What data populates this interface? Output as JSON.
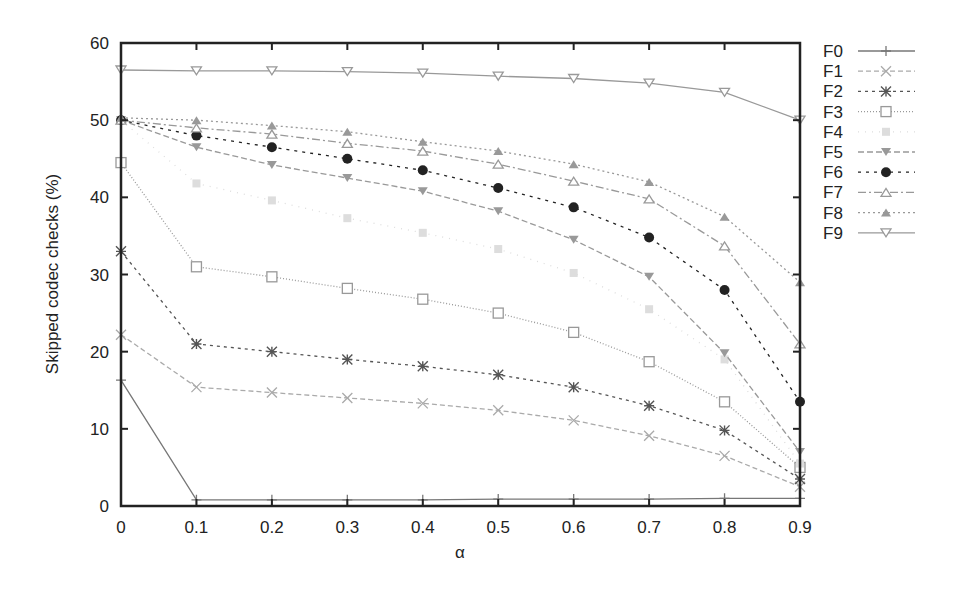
{
  "chart_data": {
    "type": "line",
    "title": "",
    "xlabel": "α",
    "ylabel": "Skipped codec checks (%)",
    "x": [
      0,
      0.1,
      0.2,
      0.3,
      0.4,
      0.5,
      0.6,
      0.7,
      0.8,
      0.9
    ],
    "x_tick_labels": [
      "0",
      "0.1",
      "0.2",
      "0.3",
      "0.4",
      "0.5",
      "0.6",
      "0.7",
      "0.8",
      "0.9"
    ],
    "y_ticks": [
      0,
      10,
      20,
      30,
      40,
      50,
      60
    ],
    "xlim": [
      0,
      0.9
    ],
    "ylim": [
      0,
      60
    ],
    "grid": false,
    "legend_position": "right-outside",
    "series": [
      {
        "name": "F0",
        "marker": "plus",
        "dash": "",
        "color": "#777777",
        "values": [
          16.3,
          0.8,
          0.8,
          0.8,
          0.8,
          0.9,
          0.9,
          0.9,
          1.0,
          1.0
        ]
      },
      {
        "name": "F1",
        "marker": "cross",
        "dash": "5,3",
        "color": "#aaaaaa",
        "values": [
          22.2,
          15.4,
          14.7,
          14.0,
          13.3,
          12.4,
          11.1,
          9.1,
          6.5,
          2.5
        ]
      },
      {
        "name": "F2",
        "marker": "star",
        "dash": "3,4",
        "color": "#555555",
        "values": [
          33.0,
          21.0,
          20.0,
          19.0,
          18.1,
          17.0,
          15.4,
          13.0,
          9.8,
          3.5
        ]
      },
      {
        "name": "F3",
        "marker": "square-open",
        "dash": "1,2",
        "color": "#999999",
        "values": [
          44.5,
          31.0,
          29.7,
          28.2,
          26.8,
          25.0,
          22.5,
          18.7,
          13.5,
          5.0
        ]
      },
      {
        "name": "F4",
        "marker": "square-filled",
        "dash": "1,6",
        "color": "#dddddd",
        "values": [
          50.0,
          41.8,
          39.6,
          37.3,
          35.4,
          33.3,
          30.2,
          25.5,
          19.0,
          5.5
        ]
      },
      {
        "name": "F5",
        "marker": "triangle-down-filled",
        "dash": "6,3",
        "color": "#999999",
        "values": [
          50.0,
          46.5,
          44.2,
          42.5,
          40.8,
          38.2,
          34.5,
          29.7,
          19.8,
          7.0
        ]
      },
      {
        "name": "F6",
        "marker": "circle-filled",
        "dash": "3,5",
        "color": "#222222",
        "values": [
          50.0,
          48.0,
          46.5,
          45.0,
          43.5,
          41.2,
          38.7,
          34.8,
          28.0,
          13.5
        ]
      },
      {
        "name": "F7",
        "marker": "triangle-up-open",
        "dash": "8,3,2,3",
        "color": "#999999",
        "values": [
          50.0,
          49.0,
          48.2,
          47.0,
          46.0,
          44.3,
          42.1,
          39.8,
          33.7,
          21.0
        ]
      },
      {
        "name": "F8",
        "marker": "triangle-up-filled",
        "dash": "2,3",
        "color": "#999999",
        "values": [
          50.3,
          50.0,
          49.3,
          48.5,
          47.2,
          46.0,
          44.3,
          42.0,
          37.5,
          29.0
        ]
      },
      {
        "name": "F9",
        "marker": "triangle-down-open",
        "dash": "",
        "color": "#999999",
        "values": [
          56.5,
          56.4,
          56.4,
          56.3,
          56.1,
          55.7,
          55.4,
          54.8,
          53.6,
          50.0
        ]
      }
    ]
  }
}
